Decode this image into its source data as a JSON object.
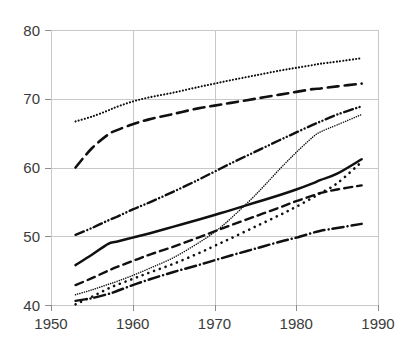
{
  "chart_data": {
    "type": "line",
    "title": "",
    "subtitle": "",
    "xlabel": "",
    "ylabel": "",
    "xlim": [
      1950,
      1990
    ],
    "ylim": [
      40,
      80
    ],
    "grid": true,
    "legend": "none",
    "x_ticks": [
      1950,
      1960,
      1970,
      1980,
      1990
    ],
    "x_tick_labels": [
      "1950",
      "1960",
      "1970",
      "1980",
      "1990"
    ],
    "y_ticks": [
      40,
      50,
      60,
      70,
      80
    ],
    "y_tick_labels": [
      "40",
      "50",
      "60",
      "70",
      "80"
    ],
    "x": [
      1953,
      1955,
      1957,
      1958,
      1960,
      1962,
      1965,
      1968,
      1970,
      1972,
      1975,
      1978,
      1980,
      1982,
      1983,
      1985,
      1988
    ],
    "series": [
      {
        "name": "series-1",
        "style": "fine-dotted",
        "color": "#101010",
        "values": [
          66.7,
          67.4,
          68.3,
          68.8,
          69.6,
          70.2,
          70.9,
          71.7,
          72.2,
          72.7,
          73.4,
          74.1,
          74.5,
          74.9,
          75.1,
          75.4,
          75.9
        ]
      },
      {
        "name": "series-2",
        "style": "long-dashed",
        "color": "#101010",
        "values": [
          60.0,
          62.8,
          64.8,
          65.4,
          66.3,
          67.0,
          67.8,
          68.6,
          69.0,
          69.4,
          70.0,
          70.6,
          71.0,
          71.4,
          71.5,
          71.8,
          72.2
        ]
      },
      {
        "name": "series-3",
        "style": "dash-dot-dot",
        "color": "#101010",
        "values": [
          50.2,
          51.2,
          52.3,
          52.8,
          53.9,
          54.9,
          56.5,
          58.2,
          59.4,
          60.6,
          62.3,
          64.0,
          65.1,
          66.2,
          66.7,
          67.7,
          68.9
        ]
      },
      {
        "name": "series-4",
        "style": "fine-dotted-steep",
        "color": "#101010",
        "values": [
          41.5,
          42.2,
          43.0,
          43.4,
          44.3,
          45.3,
          46.9,
          49.0,
          50.6,
          52.6,
          56.0,
          59.8,
          62.2,
          64.4,
          65.2,
          66.2,
          67.7
        ]
      },
      {
        "name": "series-5",
        "style": "solid",
        "color": "#101010",
        "values": [
          45.8,
          47.3,
          48.9,
          49.2,
          49.8,
          50.4,
          51.4,
          52.4,
          53.1,
          53.8,
          54.9,
          56.0,
          56.8,
          57.7,
          58.2,
          59.1,
          61.2
        ]
      },
      {
        "name": "series-6",
        "style": "medium-dotted",
        "color": "#101010",
        "values": [
          40.1,
          41.2,
          42.4,
          42.9,
          43.8,
          44.7,
          46.0,
          47.5,
          48.6,
          49.7,
          51.4,
          53.1,
          54.3,
          55.6,
          56.3,
          57.7,
          60.8
        ]
      },
      {
        "name": "series-7",
        "style": "medium-dashed",
        "color": "#101010",
        "values": [
          42.9,
          43.9,
          45.0,
          45.5,
          46.4,
          47.3,
          48.5,
          49.8,
          50.7,
          51.6,
          52.9,
          54.2,
          55.1,
          55.9,
          56.3,
          56.8,
          57.4
        ]
      },
      {
        "name": "series-8",
        "style": "dash-dot",
        "color": "#101010",
        "values": [
          40.6,
          41.0,
          41.6,
          42.0,
          42.9,
          43.7,
          44.8,
          45.8,
          46.5,
          47.2,
          48.2,
          49.2,
          49.8,
          50.5,
          50.8,
          51.2,
          51.8
        ]
      }
    ]
  },
  "axes": {
    "plot_left_px": 51,
    "plot_right_px": 378,
    "plot_top_px": 30,
    "plot_bottom_px": 305
  }
}
